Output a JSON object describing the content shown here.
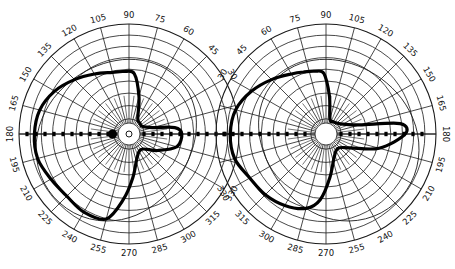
{
  "figure": {
    "type": "visual-field perimetry charts",
    "colors": {
      "grid": "#1a1a1a",
      "field_outline": "#000000",
      "background": "#ffffff"
    }
  },
  "charts": [
    {
      "name": "left-field",
      "center": [
        129,
        134
      ],
      "radius": 110,
      "ring_count": 9,
      "meridian_step_deg": 15,
      "orientation": "0-right-counterclockwise",
      "angle_labels": [
        "0",
        "15",
        "30",
        "45",
        "60",
        "75",
        "90",
        "105",
        "120",
        "135",
        "150",
        "165",
        "180",
        "195",
        "210",
        "225",
        "240",
        "255",
        "270",
        "285",
        "300",
        "315",
        "330",
        "345"
      ],
      "visible_labels": [
        "30",
        "45",
        "60",
        "75",
        "90",
        "105",
        "120",
        "135",
        "150",
        "165",
        "180",
        "195",
        "210",
        "225",
        "240",
        "255",
        "270",
        "285",
        "300",
        "315",
        "330"
      ],
      "field_outline_deg": [
        [
          0,
          0.48
        ],
        [
          8,
          0.42
        ],
        [
          15,
          0.22
        ],
        [
          30,
          0.14
        ],
        [
          45,
          0.14
        ],
        [
          60,
          0.16
        ],
        [
          75,
          0.35
        ],
        [
          85,
          0.55
        ],
        [
          95,
          0.57
        ],
        [
          105,
          0.58
        ],
        [
          120,
          0.63
        ],
        [
          135,
          0.7
        ],
        [
          150,
          0.78
        ],
        [
          165,
          0.84
        ],
        [
          180,
          0.86
        ],
        [
          195,
          0.86
        ],
        [
          210,
          0.82
        ],
        [
          225,
          0.8
        ],
        [
          240,
          0.82
        ],
        [
          255,
          0.8
        ],
        [
          265,
          0.6
        ],
        [
          275,
          0.4
        ],
        [
          290,
          0.22
        ],
        [
          310,
          0.18
        ],
        [
          330,
          0.3
        ],
        [
          345,
          0.45
        ]
      ],
      "blind_spot_deg": [
        180,
        0.15
      ]
    },
    {
      "name": "right-field",
      "center": [
        326,
        134
      ],
      "radius": 110,
      "ring_count": 9,
      "meridian_step_deg": 15,
      "orientation": "0-left-clockwise",
      "angle_labels": [
        "0",
        "15",
        "30",
        "45",
        "60",
        "75",
        "90",
        "105",
        "120",
        "135",
        "150",
        "165",
        "180",
        "195",
        "210",
        "225",
        "240",
        "255",
        "270",
        "285",
        "300",
        "315",
        "330",
        "345"
      ],
      "visible_labels": [
        "30",
        "45",
        "60",
        "75",
        "90",
        "105",
        "120",
        "135",
        "150",
        "165",
        "180",
        "195",
        "210",
        "225",
        "240",
        "255",
        "270",
        "285",
        "300",
        "315",
        "330"
      ],
      "field_outline_deg": [
        [
          180,
          0.72
        ],
        [
          172,
          0.68
        ],
        [
          165,
          0.32
        ],
        [
          150,
          0.18
        ],
        [
          135,
          0.14
        ],
        [
          120,
          0.13
        ],
        [
          105,
          0.14
        ],
        [
          95,
          0.35
        ],
        [
          88,
          0.55
        ],
        [
          80,
          0.58
        ],
        [
          70,
          0.6
        ],
        [
          60,
          0.63
        ],
        [
          45,
          0.7
        ],
        [
          30,
          0.78
        ],
        [
          15,
          0.85
        ],
        [
          0,
          0.87
        ],
        [
          345,
          0.86
        ],
        [
          330,
          0.8
        ],
        [
          315,
          0.78
        ],
        [
          300,
          0.75
        ],
        [
          285,
          0.7
        ],
        [
          275,
          0.6
        ],
        [
          265,
          0.4
        ],
        [
          250,
          0.22
        ],
        [
          230,
          0.17
        ],
        [
          210,
          0.25
        ],
        [
          195,
          0.5
        ]
      ]
    }
  ]
}
